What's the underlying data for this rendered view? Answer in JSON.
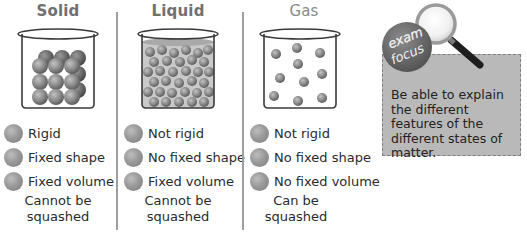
{
  "columns": [
    {
      "id": "solid",
      "title": "Solid",
      "properties": [
        "Rigid",
        "Fixed shape",
        "Fixed volume"
      ],
      "compressibility": [
        "Cannot be",
        "squashed"
      ],
      "particle_arrangement": "closely packed regular lattice"
    },
    {
      "id": "liquid",
      "title": "Liquid",
      "properties": [
        "Not rigid",
        "No fixed shape",
        "Fixed volume"
      ],
      "compressibility": [
        "Cannot be",
        "squashed"
      ],
      "particle_arrangement": "close together, random, filling container up to liquid surface"
    },
    {
      "id": "gas",
      "title": "Gas",
      "properties": [
        "Not rigid",
        "No fixed shape",
        "No fixed volume"
      ],
      "compressibility": [
        "Can be",
        "squashed"
      ],
      "particle_arrangement": "far apart, random"
    }
  ],
  "exam_focus": {
    "badge_line1": "exam",
    "badge_line2": "focus",
    "text": "Be able to explain the different features of the different states of matter."
  },
  "colors": {
    "particle": "#8c8c8c",
    "title": "#707070",
    "divider": "#9e9e9e",
    "focus_box": "#b9b9b9",
    "badge": "#6e6e6e"
  }
}
